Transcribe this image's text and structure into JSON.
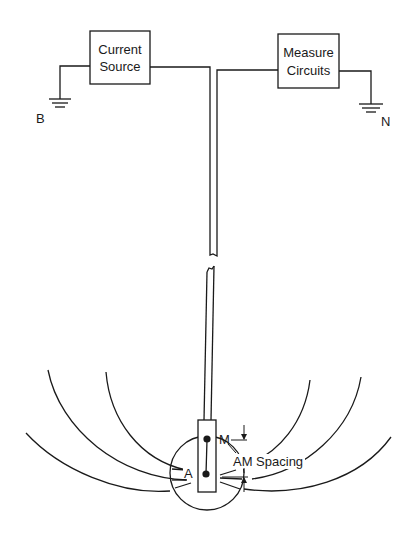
{
  "diagram": {
    "title": "",
    "blocks": {
      "current_source": {
        "line1": "Current",
        "line2": "Source"
      },
      "measure_circuits": {
        "line1": "Measure",
        "line2": "Circuits"
      }
    },
    "ground_labels": {
      "left": "B",
      "right": "N"
    },
    "electrodes": {
      "current": "A",
      "measure": "M"
    },
    "spacing_label": "AM Spacing",
    "colors": {
      "line": "#1a1a1a",
      "background": "#ffffff"
    }
  }
}
